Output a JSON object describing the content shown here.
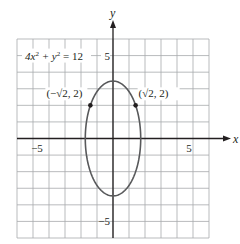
{
  "chart_data": {
    "type": "line",
    "title": "",
    "xlabel": "x",
    "ylabel": "y",
    "xlim": [
      -6,
      6
    ],
    "ylim": [
      -6,
      6
    ],
    "grid": true,
    "x_ticks": [
      {
        "value": -5,
        "label": "−5"
      },
      {
        "value": 5,
        "label": "5"
      }
    ],
    "y_ticks": [
      {
        "value": 5,
        "label": "5"
      },
      {
        "value": -5,
        "label": "−5"
      }
    ],
    "series": [
      {
        "name": "ellipse",
        "equation": "4x² + y² = 12",
        "semi_axis_x": 1.732,
        "semi_axis_y": 3.464,
        "center": [
          0,
          0
        ]
      }
    ],
    "points": [
      {
        "x": -1.414,
        "y": 2,
        "label": "(−√2, 2)"
      },
      {
        "x": 1.414,
        "y": 2,
        "label": "(√2, 2)"
      }
    ],
    "annotations": [
      {
        "text_parts": [
          "4x",
          "2",
          " + y",
          "2",
          " = 12"
        ],
        "at_y": 5
      }
    ],
    "colors": {
      "grid": "#a7a9ac",
      "axis": "#231f20",
      "curve": "#58595b",
      "point": "#231f20"
    }
  }
}
